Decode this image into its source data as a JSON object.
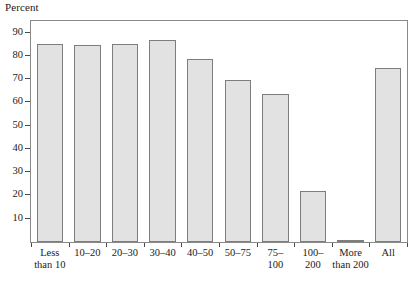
{
  "chart_data": {
    "type": "bar",
    "title": "Percent",
    "xlabel": "",
    "ylabel": "Percent",
    "ylim": [
      0,
      95
    ],
    "grid": false,
    "legend": null,
    "categories": [
      "Less than 10",
      "10–20",
      "20–30",
      "30–40",
      "40–50",
      "50–75",
      "75–100",
      "100–200",
      "More than 200",
      "All"
    ],
    "category_lines": [
      [
        "Less",
        "than 10"
      ],
      [
        "10–20"
      ],
      [
        "20–30"
      ],
      [
        "30–40"
      ],
      [
        "40–50"
      ],
      [
        "50–75"
      ],
      [
        "75–",
        "100"
      ],
      [
        "100–",
        "200"
      ],
      [
        "More",
        "than 200"
      ],
      [
        "All"
      ]
    ],
    "values": [
      85,
      84.8,
      85.1,
      86.8,
      78.8,
      69.5,
      63.5,
      21.8,
      0.5,
      74.8
    ],
    "yticks": [
      10,
      20,
      30,
      40,
      50,
      60,
      70,
      80,
      90
    ],
    "ytick_labels": [
      "10",
      "20",
      "30",
      "40",
      "50",
      "60",
      "70",
      "80",
      "90"
    ],
    "colors": {
      "bar_fill": "#e2e2e2",
      "bar_border": "#7d7d7d",
      "frame": "#8a8a8a",
      "text": "#1a1a1a"
    }
  },
  "caption": {
    "cropped_line": ""
  }
}
